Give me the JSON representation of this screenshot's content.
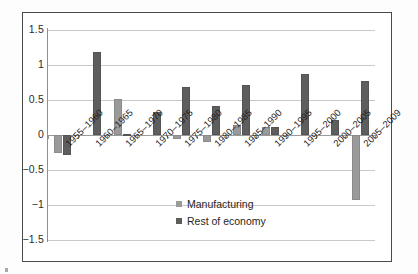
{
  "chart_data": {
    "type": "bar",
    "title": "",
    "subtitle": "",
    "xlabel": "",
    "ylabel": "",
    "ylim": [
      -1.5,
      1.5
    ],
    "yticks": [
      "1.5",
      "1",
      "0.5",
      "0",
      "−0.5",
      "−1",
      "−1.5"
    ],
    "ytick_values": [
      1.5,
      1,
      0.5,
      0,
      -0.5,
      -1,
      -1.5
    ],
    "grid": true,
    "legend_position": "bottom-center",
    "categories": [
      "1955–1960",
      "1960–1965",
      "1965–1970",
      "1970–1975",
      "1975–1980",
      "1980–1985",
      "1985–1990",
      "1990–1995",
      "1995–2000",
      "2000–2005",
      "2005–2009"
    ],
    "series": [
      {
        "name": "Manufacturing",
        "color": "#9a9a9a",
        "values": [
          -0.26,
          0.0,
          0.51,
          0.0,
          -0.05,
          -0.1,
          0.14,
          0.12,
          0.0,
          0.0,
          -0.93
        ]
      },
      {
        "name": "Rest of economy",
        "color": "#5e5e5e",
        "values": [
          -0.29,
          1.19,
          0.02,
          0.33,
          0.68,
          0.42,
          0.72,
          0.11,
          0.87,
          0.21,
          0.77
        ]
      }
    ]
  },
  "legend": {
    "items": [
      {
        "label": "Manufacturing",
        "color": "#9a9a9a"
      },
      {
        "label": "Rest of economy",
        "color": "#5e5e5e"
      }
    ]
  },
  "colors": {
    "manufacturing": "#9a9a9a",
    "rest_of_economy": "#5e5e5e",
    "grid": "#c9c9c9",
    "axis": "#8f8f8f",
    "frame": "#4a4a4a",
    "background": "#ffffff"
  }
}
